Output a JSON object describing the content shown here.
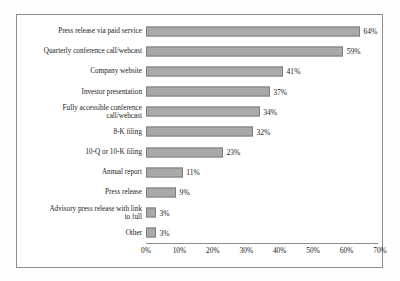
{
  "chart_data": {
    "type": "bar",
    "orientation": "horizontal",
    "title": "",
    "xlabel": "",
    "ylabel": "",
    "xlim": [
      0,
      70
    ],
    "grid": false,
    "legend": false,
    "xticks": [
      "0%",
      "10%",
      "20%",
      "30%",
      "40%",
      "50%",
      "60%",
      "70%"
    ],
    "xtick_values": [
      0,
      10,
      20,
      30,
      40,
      50,
      60,
      70
    ],
    "categories": [
      "Press release via paid service",
      "Quarterly conference call/webcast",
      "Company website",
      "Investor presentation",
      "Fully accessible conference\ncall/webcast",
      "8-K filing",
      "10-Q or 10-K filing",
      "Annual report",
      "Press release",
      "Advisory press release with link\nto full",
      "Other"
    ],
    "values": [
      64,
      59,
      41,
      37,
      34,
      32,
      23,
      11,
      9,
      3,
      3
    ],
    "value_labels": [
      "64%",
      "59%",
      "41%",
      "37%",
      "34%",
      "32%",
      "23%",
      "11%",
      "9%",
      "3%",
      "3%"
    ],
    "bar_color": "#a9a9a9",
    "bar_border_color": "#7d7d7d",
    "frame_color": "#8d8d8d",
    "background_color": "#ffffff",
    "text_color": "#1a1a1a"
  }
}
